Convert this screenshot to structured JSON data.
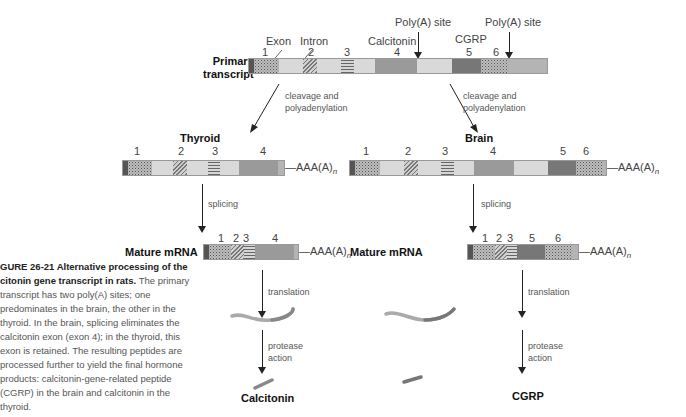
{
  "figure": {
    "primary": {
      "label_line1": "Primary",
      "label_line2": "transcript",
      "exon_label": "Exon",
      "intron_label": "Intron",
      "calcitonin_label": "Calcitonin",
      "cgrp_label": "CGRP",
      "polya_site_1": "Poly(A) site",
      "polya_site_2": "Poly(A) site",
      "exon_numbers": [
        "1",
        "2",
        "3",
        "4",
        "5",
        "6"
      ]
    },
    "left_branch": {
      "step1": "cleavage and\npolyadenylation",
      "tissue": "Thyroid",
      "exon_numbers": [
        "1",
        "2",
        "3",
        "4"
      ],
      "tail": "AAA(A)",
      "tail_sub": "n",
      "step2": "splicing",
      "mature_label": "Mature mRNA",
      "mature_exon_numbers": [
        "1",
        "2",
        "3",
        "4"
      ],
      "step3": "translation",
      "step4_line1": "protease",
      "step4_line2": "action",
      "product": "Calcitonin"
    },
    "right_branch": {
      "step1": "cleavage and\npolyadenylation",
      "tissue": "Brain",
      "exon_numbers": [
        "1",
        "2",
        "3",
        "4",
        "5",
        "6"
      ],
      "tail": "AAA(A)",
      "tail_sub": "n",
      "step2": "splicing",
      "mature_label": "Mature mRNA",
      "mature_exon_numbers": [
        "1",
        "2",
        "3",
        "5",
        "6"
      ],
      "step3": "translation",
      "step4_line1": "protease",
      "step4_line2": "action",
      "product": "CGRP"
    },
    "caption": {
      "title": "GURE 26-21 Alternative processing of the citonin gene transcript in rats.",
      "body": "The primary transcript has two poly(A) sites; one predominates in the brain, the other in the thyroid. In the brain, splicing eliminates the calcitonin exon (exon 4); in the thyroid, this exon is retained. The resulting peptides are processed further to yield the final hormone products: calcitonin-gene-related peptide (CGRP) in the brain and calcitonin in the thyroid."
    },
    "colors": {
      "exon4": "#9a9a9a",
      "exon5": "#777777",
      "intron": "#d9d9d9",
      "line": "#222222"
    }
  }
}
